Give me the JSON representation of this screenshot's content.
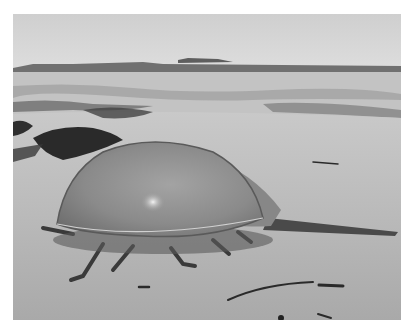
{
  "image": {
    "description": "Grayscale photograph of a horseshoe crab on a sandy beach with seaweed, water and distant shoreline in the background",
    "subject": "horseshoe crab",
    "setting": "beach",
    "palette": {
      "sky": "#d6d6d6",
      "sea": "#bdbdbd",
      "sand": "#b4b4b4",
      "shell": "#8e8e8e",
      "shell_highlight": "#e8e8e8",
      "seaweed": "#2e2e2e",
      "border": "#ffffff"
    }
  }
}
